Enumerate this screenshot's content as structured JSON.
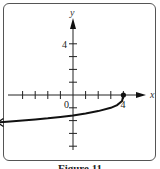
{
  "chart_data": {
    "type": "line",
    "title": "",
    "caption": "Figure 11",
    "xlabel": "x",
    "ylabel": "y",
    "xlim": [
      -5,
      5
    ],
    "ylim": [
      -5,
      5
    ],
    "x_ticks": [
      -4,
      -3,
      -2,
      -1,
      1,
      2,
      3,
      4
    ],
    "y_ticks": [
      -4,
      -3,
      -2,
      -1,
      1,
      2,
      3,
      4
    ],
    "x_tick_labels": [
      {
        "value": 4,
        "label": "4"
      }
    ],
    "y_tick_labels": [
      {
        "value": 4,
        "label": "4"
      }
    ],
    "origin_label": "0",
    "grid": false,
    "series": [
      {
        "name": "f(x)",
        "description": "curve y = -cbrt(4 - x), endpoint at (4, 0), arrow toward left",
        "x": [
          -6,
          -5,
          -4,
          -3,
          -2,
          -1,
          0,
          1,
          2,
          3,
          3.5,
          3.9,
          4
        ],
        "y": [
          -2.15,
          -2.08,
          -2.0,
          -1.91,
          -1.82,
          -1.71,
          -1.59,
          -1.44,
          -1.26,
          -1.0,
          -0.79,
          -0.46,
          0
        ],
        "endpoint": {
          "x": 4,
          "y": 0,
          "style": "closed"
        },
        "arrow": "left"
      }
    ]
  }
}
